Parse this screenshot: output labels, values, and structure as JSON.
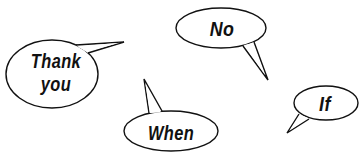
{
  "canvas": {
    "width": 363,
    "height": 162,
    "background": "#ffffff"
  },
  "style": {
    "stroke_color": "#111111",
    "fill_color": "#ffffff",
    "text_color": "#111111"
  },
  "bubbles": [
    {
      "id": "thank-you",
      "lines": [
        "Thank",
        "you"
      ],
      "ellipse": {
        "cx": 52,
        "cy": 74,
        "rx": 46,
        "ry": 34
      },
      "tail": {
        "base1": [
          76,
          45
        ],
        "tip": [
          124,
          42
        ],
        "base2": [
          88,
          53
        ]
      }
    },
    {
      "id": "no",
      "lines": [
        "No"
      ],
      "ellipse": {
        "cx": 221,
        "cy": 28,
        "rx": 45,
        "ry": 20
      },
      "tail": {
        "base1": [
          243,
          46
        ],
        "tip": [
          268,
          80
        ],
        "base2": [
          254,
          42
        ]
      }
    },
    {
      "id": "when",
      "lines": [
        "When"
      ],
      "ellipse": {
        "cx": 171,
        "cy": 131,
        "rx": 47,
        "ry": 20
      },
      "tail": {
        "base1": [
          149,
          113
        ],
        "tip": [
          144,
          79
        ],
        "base2": [
          162,
          111
        ]
      }
    },
    {
      "id": "if",
      "lines": [
        "If"
      ],
      "ellipse": {
        "cx": 326,
        "cy": 103,
        "rx": 32,
        "ry": 17
      },
      "tail": {
        "base1": [
          299,
          114
        ],
        "tip": [
          287,
          133
        ],
        "base2": [
          309,
          119
        ]
      }
    }
  ]
}
